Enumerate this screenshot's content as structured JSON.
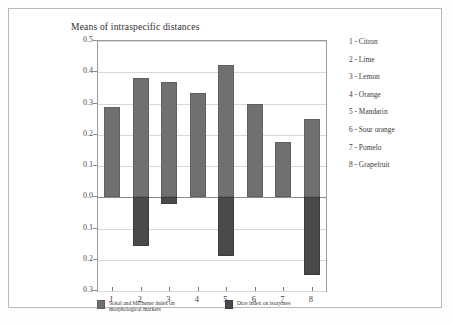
{
  "figure": {
    "title": "Means of intraspecific distances"
  },
  "chart_data": {
    "type": "bar",
    "title": "Means of intraspecific distances",
    "xlabel": "",
    "ylabel": "",
    "ylim": [
      -0.3,
      0.5
    ],
    "grid": true,
    "legend_position": "bottom",
    "orientation": "vertical",
    "categories": [
      "1",
      "2",
      "3",
      "4",
      "5",
      "6",
      "7",
      "8"
    ],
    "category_names": [
      "Citron",
      "Lime",
      "Lemon",
      "Orange",
      "Mandarin",
      "Sour orange",
      "Pomelo",
      "Grapefruit"
    ],
    "ytick_labels": [
      "0.5",
      "0.4",
      "0.3",
      "0.2",
      "0.1",
      "0.0",
      "0.1",
      "0.2",
      "0.3"
    ],
    "ytick_values": [
      0.5,
      0.4,
      0.3,
      0.2,
      0.1,
      0.0,
      -0.1,
      -0.2,
      -0.3
    ],
    "series": [
      {
        "name": "Sokal and Michener index on morphological markers",
        "color": "#707070",
        "values": [
          0.29,
          0.383,
          0.37,
          0.333,
          0.423,
          0.3,
          0.178,
          0.252
        ]
      },
      {
        "name": "Dice index on isozymes",
        "color": "#4a4a4a",
        "values": [
          0.0,
          -0.155,
          -0.022,
          0.0,
          -0.187,
          0.0,
          0.0,
          -0.25
        ]
      }
    ]
  },
  "legend": {
    "entries": [
      {
        "label": "Sokal and Michener index on morphological markers",
        "color": "#707070"
      },
      {
        "label": "Dice index on isozymes",
        "color": "#4a4a4a"
      }
    ]
  },
  "species_key": {
    "items": [
      "1 - Citron",
      "2 - Lime",
      "3 - Lemon",
      "4 - Orange",
      "5 - Mandarin",
      "6 - Sour orange",
      "7 - Pomelo",
      "8 - Grapefruit"
    ]
  }
}
